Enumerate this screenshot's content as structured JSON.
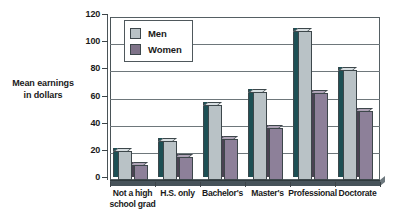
{
  "chart_data": {
    "type": "bar",
    "title": "",
    "xlabel": "",
    "ylabel": "Mean earnings\nin dollars",
    "ylabel_lines": [
      "Mean earnings",
      "in dollars"
    ],
    "ylim": [
      0,
      120
    ],
    "yticks": [
      0,
      20,
      40,
      60,
      80,
      100,
      120
    ],
    "ytick_labels": [
      "0",
      "20",
      "40",
      "60",
      "80",
      "100",
      "120"
    ],
    "grid": true,
    "grid_axis": "y",
    "legend_position": "top-left-inside",
    "style": "3d-column",
    "categories": [
      "Not a high\nschool grad",
      "H.S. only",
      "Bachelor's",
      "Master's",
      "Professional",
      "Doctorate"
    ],
    "category_labels": [
      [
        "Not a high",
        "school grad"
      ],
      [
        "H.S. only"
      ],
      [
        "Bachelor's"
      ],
      [
        "Master's"
      ],
      [
        "Professional"
      ],
      [
        "Doctorate"
      ]
    ],
    "series": [
      {
        "name": "Men",
        "color": "#b9c2c6",
        "side_color": "#1d5055",
        "top_color": "#d7dee1",
        "values": [
          21,
          29,
          55,
          65,
          110,
          81
        ]
      },
      {
        "name": "Women",
        "color": "#8d8099",
        "side_color": "#4a4252",
        "top_color": "#aea3b6",
        "values": [
          11,
          17,
          30,
          38,
          64,
          51
        ]
      }
    ]
  },
  "legend": {
    "entries": [
      {
        "label": "Men",
        "swatch": "#b9c2c6"
      },
      {
        "label": "Women",
        "swatch": "#7f7389"
      }
    ]
  },
  "colors": {
    "background": "#ffffff",
    "axis": "#3c4448",
    "grid": "#6e777b",
    "frame": "#555f63",
    "floor": "#47535a",
    "text": "#1a1a1a"
  }
}
